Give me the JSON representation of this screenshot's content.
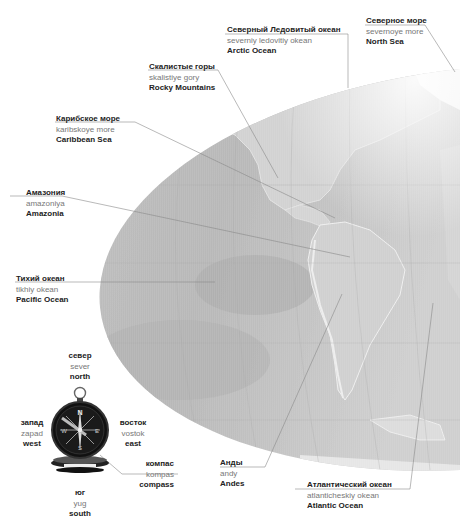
{
  "labels": {
    "arctic": {
      "ru": "Северный Ледовитый океан",
      "tr": "severniy ledovitiy okean",
      "en": "Arctic Ocean"
    },
    "northsea": {
      "ru": "Северное море",
      "tr": "severnoye more",
      "en": "North Sea"
    },
    "rocky": {
      "ru": "Скалистые горы",
      "tr": "skalistiye gory",
      "en": "Rocky Mountains"
    },
    "caribbean": {
      "ru": "Карибское море",
      "tr": "karibskoye more",
      "en": "Caribbean Sea"
    },
    "amazonia": {
      "ru": "Амазония",
      "tr": "amazoniya",
      "en": "Amazonia"
    },
    "pacific": {
      "ru": "Тихий океан",
      "tr": "tikhiy okean",
      "en": "Pacific Ocean"
    },
    "andes": {
      "ru": "Анды",
      "tr": "andy",
      "en": "Andes"
    },
    "atlantic": {
      "ru": "Атлантический океан",
      "tr": "atlanticheskiy okean",
      "en": "Atlantic Ocean"
    },
    "compass": {
      "ru": "компас",
      "tr": "kompas",
      "en": "compass"
    },
    "north": {
      "ru": "север",
      "tr": "sever",
      "en": "north"
    },
    "south": {
      "ru": "юг",
      "tr": "yug",
      "en": "south"
    },
    "west": {
      "ru": "запад",
      "tr": "zapad",
      "en": "west"
    },
    "east": {
      "ru": "восток",
      "tr": "vostok",
      "en": "east"
    }
  },
  "compass_letters": {
    "n": "N",
    "s": "S",
    "e": "E",
    "w": "W"
  },
  "colors": {
    "ocean": "#b9b9b9",
    "land": "#d6d6d6",
    "leader": "#8a8a8a",
    "text_dark": "#222222",
    "text_grey": "#777777"
  }
}
